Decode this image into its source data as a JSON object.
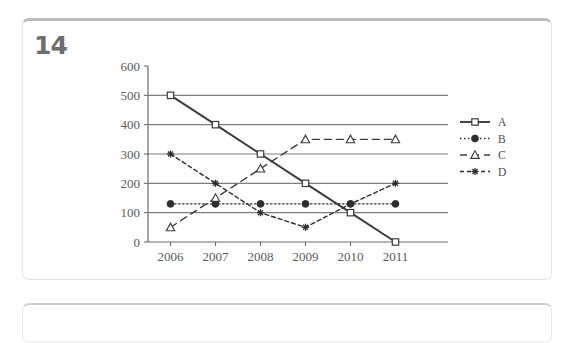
{
  "page": {
    "question_number": "14"
  },
  "chart_data": {
    "type": "line",
    "title": "",
    "xlabel": "",
    "ylabel": "",
    "categories": [
      "2006",
      "2007",
      "2008",
      "2009",
      "2010",
      "2011"
    ],
    "ylim": [
      0,
      600
    ],
    "ytick_step": 100,
    "yticks": [
      "0",
      "100",
      "200",
      "300",
      "400",
      "500",
      "600"
    ],
    "grid": "horizontal gridlines at 100,200,300,400,500",
    "legend_position": "right",
    "series": [
      {
        "name": "A",
        "values": [
          500,
          400,
          300,
          200,
          100,
          0
        ],
        "line_style": "solid",
        "marker": "open-square",
        "color": "#3a3a3a"
      },
      {
        "name": "B",
        "values": [
          130,
          130,
          130,
          130,
          130,
          130
        ],
        "line_style": "dotted",
        "marker": "filled-circle",
        "color": "#2e2e2e"
      },
      {
        "name": "C",
        "values": [
          50,
          150,
          250,
          350,
          350,
          350
        ],
        "line_style": "dashed",
        "marker": "open-triangle",
        "color": "#3a3a3a"
      },
      {
        "name": "D",
        "values": [
          300,
          200,
          100,
          50,
          130,
          200
        ],
        "line_style": "dashed-short",
        "marker": "asterisk",
        "color": "#2e2e2e"
      }
    ]
  },
  "colors": {
    "axis": "#6a6a6a",
    "grid": "#7d7d7d",
    "tick_text": "#5a5a5a",
    "card_border": "#e3e3e3",
    "card_top_rule": "#bcbcbc",
    "question_number": "#6e6e6e"
  }
}
